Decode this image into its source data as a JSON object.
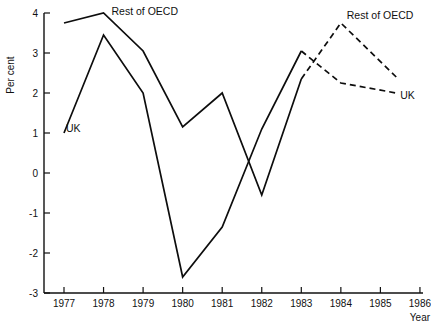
{
  "chart_data": {
    "type": "line",
    "title": "",
    "xlabel": "Year",
    "ylabel": "Per cent",
    "xlim": [
      1976.5,
      1986.5
    ],
    "ylim": [
      -3,
      4
    ],
    "grid": false,
    "legend_position": "inline-annotations",
    "x_ticks": [
      "1977",
      "1978",
      "1979",
      "1980",
      "1981",
      "1982",
      "1983",
      "1984",
      "1985",
      "1986"
    ],
    "y_ticks": [
      "4",
      "3",
      "2",
      "1",
      "0",
      "-1",
      "-2",
      "-3"
    ],
    "series": [
      {
        "name": "Rest of OECD",
        "style": "solid",
        "x": [
          1977,
          1978,
          1979,
          1980,
          1981,
          1982,
          1983
        ],
        "values": [
          3.75,
          4.0,
          3.05,
          1.15,
          2.0,
          -0.55,
          2.35
        ]
      },
      {
        "name": "Rest of OECD",
        "style": "dashed",
        "x": [
          1983,
          1984,
          1985.4
        ],
        "values": [
          2.35,
          3.75,
          2.4
        ]
      },
      {
        "name": "UK",
        "style": "solid",
        "x": [
          1977,
          1978,
          1979,
          1980,
          1981,
          1982,
          1983
        ],
        "values": [
          1.0,
          3.45,
          2.0,
          -2.6,
          -1.35,
          1.1,
          3.05
        ]
      },
      {
        "name": "UK",
        "style": "dashed",
        "x": [
          1983,
          1984,
          1985.4
        ],
        "values": [
          3.05,
          2.25,
          2.0
        ]
      }
    ],
    "annotations": [
      {
        "text": "Rest of OECD",
        "x": 1978.2,
        "y": 3.95,
        "anchor": "start"
      },
      {
        "text": "UK",
        "x": 1977.05,
        "y": 1.02,
        "anchor": "start"
      },
      {
        "text": "Rest of OECD",
        "x": 1984.15,
        "y": 3.85,
        "anchor": "start"
      },
      {
        "text": "UK",
        "x": 1985.5,
        "y": 1.85,
        "anchor": "start"
      }
    ]
  }
}
